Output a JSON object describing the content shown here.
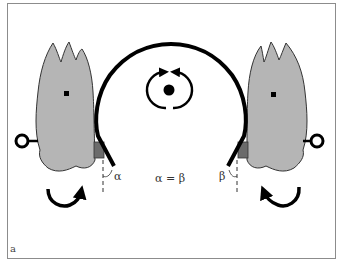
{
  "figure": {
    "panel_label": "a",
    "equation_label": "α = β",
    "left_angle_label": "α",
    "right_angle_label": "β",
    "colors": {
      "tooth_fill": "#b5b5b5",
      "tooth_stroke": "#333333",
      "bracket_fill": "#6b6b6b",
      "wire": "#000000",
      "frame": "#8c8c8c"
    },
    "elements": [
      {
        "name": "left-tooth",
        "type": "tooth"
      },
      {
        "name": "right-tooth",
        "type": "tooth"
      },
      {
        "name": "archwire",
        "type": "arch"
      },
      {
        "name": "rotation-icon",
        "type": "rotation"
      },
      {
        "name": "left-rotation-arrow",
        "direction": "clockwise"
      },
      {
        "name": "right-rotation-arrow",
        "direction": "counterclockwise"
      }
    ]
  }
}
